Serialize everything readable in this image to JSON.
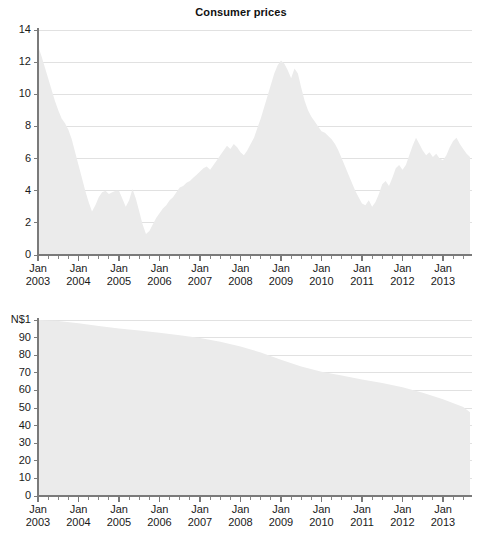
{
  "figure": {
    "background": "#ffffff",
    "area_fill": "#ebebeb",
    "gridline_color": "#d9d9d9",
    "axis_color": "#7a7a7a",
    "text_color": "#1a1a1a"
  },
  "charts": [
    {
      "id": "consumer-prices",
      "title": "Consumer prices",
      "ylabel": "",
      "yticks": [
        "0",
        "2",
        "4",
        "6",
        "8",
        "10",
        "12",
        "14"
      ],
      "xticks": [
        {
          "line1": "Jan",
          "line2": "2003"
        },
        {
          "line1": "Jan",
          "line2": "2004"
        },
        {
          "line1": "Jan",
          "line2": "2005"
        },
        {
          "line1": "Jan",
          "line2": "2006"
        },
        {
          "line1": "Jan",
          "line2": "2007"
        },
        {
          "line1": "Jan",
          "line2": "2008"
        },
        {
          "line1": "Jan",
          "line2": "2009"
        },
        {
          "line1": "Jan",
          "line2": "2010"
        },
        {
          "line1": "Jan",
          "line2": "2011"
        },
        {
          "line1": "Jan",
          "line2": "2012"
        },
        {
          "line1": "Jan",
          "line2": "2013"
        }
      ]
    },
    {
      "id": "purchasing-power",
      "title": "Purchasing power",
      "ylabel": "N$1",
      "yticks": [
        "0",
        "10",
        "20",
        "30",
        "40",
        "50",
        "60",
        "70",
        "80",
        "90",
        "N$1"
      ],
      "xticks": [
        {
          "line1": "Jan",
          "line2": "2003"
        },
        {
          "line1": "Jan",
          "line2": "2004"
        },
        {
          "line1": "Jan",
          "line2": "2005"
        },
        {
          "line1": "Jan",
          "line2": "2006"
        },
        {
          "line1": "Jan",
          "line2": "2007"
        },
        {
          "line1": "Jan",
          "line2": "2008"
        },
        {
          "line1": "Jan",
          "line2": "2009"
        },
        {
          "line1": "Jan",
          "line2": "2010"
        },
        {
          "line1": "Jan",
          "line2": "2011"
        },
        {
          "line1": "Jan",
          "line2": "2012"
        },
        {
          "line1": "Jan",
          "line2": "2013"
        }
      ]
    }
  ],
  "chart_data": [
    {
      "type": "area",
      "id": "consumer-prices",
      "title": "Consumer prices",
      "xlabel": "",
      "ylabel": "",
      "ylim": [
        0,
        14
      ],
      "xlim": [
        "2003-01",
        "2013-09"
      ],
      "grid": true,
      "legend": "none",
      "x_tick_interval_months": 12,
      "minor_tick_interval_months": 3,
      "series_name": "Inflation rate (% year-on-year)",
      "x": [
        "2003-01",
        "2003-02",
        "2003-03",
        "2003-04",
        "2003-05",
        "2003-06",
        "2003-07",
        "2003-08",
        "2003-09",
        "2003-10",
        "2003-11",
        "2003-12",
        "2004-01",
        "2004-02",
        "2004-03",
        "2004-04",
        "2004-05",
        "2004-06",
        "2004-07",
        "2004-08",
        "2004-09",
        "2004-10",
        "2004-11",
        "2004-12",
        "2005-01",
        "2005-02",
        "2005-03",
        "2005-04",
        "2005-05",
        "2005-06",
        "2005-07",
        "2005-08",
        "2005-09",
        "2005-10",
        "2005-11",
        "2005-12",
        "2006-01",
        "2006-02",
        "2006-03",
        "2006-04",
        "2006-05",
        "2006-06",
        "2006-07",
        "2006-08",
        "2006-09",
        "2006-10",
        "2006-11",
        "2006-12",
        "2007-01",
        "2007-02",
        "2007-03",
        "2007-04",
        "2007-05",
        "2007-06",
        "2007-07",
        "2007-08",
        "2007-09",
        "2007-10",
        "2007-11",
        "2007-12",
        "2008-01",
        "2008-02",
        "2008-03",
        "2008-04",
        "2008-05",
        "2008-06",
        "2008-07",
        "2008-08",
        "2008-09",
        "2008-10",
        "2008-11",
        "2008-12",
        "2009-01",
        "2009-02",
        "2009-03",
        "2009-04",
        "2009-05",
        "2009-06",
        "2009-07",
        "2009-08",
        "2009-09",
        "2009-10",
        "2009-11",
        "2009-12",
        "2010-01",
        "2010-02",
        "2010-03",
        "2010-04",
        "2010-05",
        "2010-06",
        "2010-07",
        "2010-08",
        "2010-09",
        "2010-10",
        "2010-11",
        "2010-12",
        "2011-01",
        "2011-02",
        "2011-03",
        "2011-04",
        "2011-05",
        "2011-06",
        "2011-07",
        "2011-08",
        "2011-09",
        "2011-10",
        "2011-11",
        "2011-12",
        "2012-01",
        "2012-02",
        "2012-03",
        "2012-04",
        "2012-05",
        "2012-06",
        "2012-07",
        "2012-08",
        "2012-09",
        "2012-10",
        "2012-11",
        "2012-12",
        "2013-01",
        "2013-02",
        "2013-03",
        "2013-04",
        "2013-05",
        "2013-06",
        "2013-07",
        "2013-08",
        "2013-09"
      ],
      "values": [
        13.0,
        12.4,
        11.7,
        11.0,
        10.3,
        9.6,
        9.0,
        8.5,
        8.2,
        7.8,
        7.2,
        6.4,
        5.6,
        4.8,
        4.0,
        3.3,
        2.7,
        3.1,
        3.6,
        3.9,
        4.0,
        3.8,
        3.9,
        4.0,
        4.0,
        3.5,
        3.0,
        3.4,
        4.1,
        3.5,
        2.7,
        1.9,
        1.3,
        1.5,
        1.9,
        2.3,
        2.6,
        2.9,
        3.1,
        3.4,
        3.6,
        3.9,
        4.2,
        4.3,
        4.5,
        4.6,
        4.8,
        5.0,
        5.2,
        5.4,
        5.5,
        5.3,
        5.6,
        5.9,
        6.2,
        6.5,
        6.8,
        6.6,
        6.9,
        6.7,
        6.4,
        6.2,
        6.5,
        6.9,
        7.3,
        7.9,
        8.5,
        9.2,
        9.9,
        10.6,
        11.3,
        11.8,
        12.1,
        11.9,
        11.5,
        11.0,
        11.6,
        11.3,
        10.4,
        9.6,
        9.0,
        8.6,
        8.3,
        8.0,
        7.7,
        7.6,
        7.4,
        7.2,
        6.9,
        6.5,
        6.0,
        5.5,
        5.0,
        4.5,
        4.0,
        3.6,
        3.2,
        3.1,
        3.4,
        3.0,
        3.3,
        3.8,
        4.4,
        4.6,
        4.3,
        4.8,
        5.4,
        5.6,
        5.3,
        5.6,
        6.2,
        6.8,
        7.3,
        6.9,
        6.5,
        6.2,
        6.4,
        6.1,
        6.3,
        6.0,
        5.9,
        6.2,
        6.7,
        7.1,
        7.3,
        6.9,
        6.6,
        6.3,
        6.1
      ]
    },
    {
      "type": "area",
      "id": "purchasing-power",
      "title": "Purchasing power",
      "xlabel": "",
      "ylabel": "N$1",
      "ylim": [
        0,
        100
      ],
      "xlim": [
        "2003-01",
        "2013-09"
      ],
      "grid": true,
      "legend": "none",
      "x_tick_interval_months": 12,
      "minor_tick_interval_months": 3,
      "series_name": "Purchasing power of N$1 (2003 = 100)",
      "x": [
        "2003-01",
        "2003-07",
        "2004-01",
        "2004-07",
        "2005-01",
        "2005-07",
        "2006-01",
        "2006-07",
        "2007-01",
        "2007-07",
        "2008-01",
        "2008-07",
        "2009-01",
        "2009-07",
        "2010-01",
        "2010-07",
        "2011-01",
        "2011-07",
        "2012-01",
        "2012-07",
        "2013-01",
        "2013-07",
        "2013-09"
      ],
      "values": [
        100.0,
        99.4,
        98.2,
        96.6,
        95.2,
        94.0,
        92.8,
        91.4,
        89.8,
        87.6,
        85.0,
        81.6,
        77.4,
        73.6,
        70.6,
        68.4,
        66.2,
        64.2,
        61.8,
        58.6,
        55.0,
        50.6,
        47.6
      ]
    }
  ]
}
